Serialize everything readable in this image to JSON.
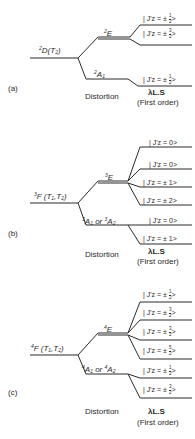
{
  "line_color": "#2a2a2a",
  "panels": [
    {
      "id": "a",
      "label": "(a)",
      "term": {
        "mult": "2",
        "L": "D",
        "sym": "T",
        "sub": "2",
        "full": "2D(T2)"
      },
      "upper": {
        "mult": "2",
        "sym": "E"
      },
      "lower": {
        "mult": "2",
        "sym": "A",
        "sub": "1",
        "alt": ""
      },
      "states": [
        {
          "text": "| J'z = ± ",
          "num": "1",
          "den": "2"
        },
        {
          "text": "| J'z = ± ",
          "num": "3",
          "den": "2"
        },
        {
          "text": "| J'z = ± ",
          "num": "1",
          "den": "2"
        }
      ],
      "distortion_label": "Distortion",
      "soc_label": "λL.S",
      "order_label": "(First order)"
    },
    {
      "id": "b",
      "label": "(b)",
      "term": {
        "mult": "3",
        "L": "F",
        "sym": "T1,T2",
        "full": "3F(T1,T2)"
      },
      "upper": {
        "mult": "3",
        "sym": "E"
      },
      "lower": {
        "text": "3A1 or 3A2",
        "or": "or"
      },
      "states": [
        {
          "text": "| J'z = 0>"
        },
        {
          "text": "| J'z = 0>"
        },
        {
          "text": "| J'z = ± 1>"
        },
        {
          "text": "| J'z = ± 2>"
        },
        {
          "text": "| J'z = 0>"
        },
        {
          "text": "| J'z = ± 1>"
        }
      ],
      "distortion_label": "Distortion",
      "soc_label": "λL.S",
      "order_label": "(First order)"
    },
    {
      "id": "c",
      "label": "(c)",
      "term": {
        "mult": "4",
        "L": "F",
        "sym": "T1,T2",
        "full": "4F(T1,T2)"
      },
      "upper": {
        "mult": "4",
        "sym": "E"
      },
      "lower": {
        "text": "4A1 or 4A2",
        "or": "or"
      },
      "states": [
        {
          "text": "| J'z = ± ",
          "num": "1",
          "den": "2"
        },
        {
          "text": "| J'z = ± ",
          "num": "3",
          "den": "2"
        },
        {
          "text": "| J'z = ± ",
          "num": "3",
          "den": "2"
        },
        {
          "text": "| J'z = ± ",
          "num": "5",
          "den": "2"
        },
        {
          "text": "| J'z = ± ",
          "num": "1",
          "den": "2"
        },
        {
          "text": "| J'z = ± ",
          "num": "3",
          "den": "2"
        }
      ],
      "distortion_label": "Distortion",
      "soc_label": "λL.S",
      "order_label": "(First order)"
    }
  ]
}
